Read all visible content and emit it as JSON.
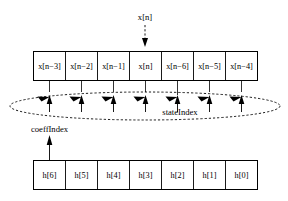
{
  "diagram": {
    "input_label": "x[n]",
    "state_index_label": "stateIndex",
    "coeff_index_label": "coeffIndex",
    "state_buffer": {
      "name": "state-buffer",
      "cells": [
        {
          "base": "x[n",
          "sub": "−3",
          "close": "]",
          "full": "x[n−3]"
        },
        {
          "base": "x[n",
          "sub": "−2",
          "close": "]",
          "full": "x[n−2]"
        },
        {
          "base": "x[n",
          "sub": "−1",
          "close": "]",
          "full": "x[n−1]"
        },
        {
          "base": "x[n",
          "sub": "",
          "close": "]",
          "full": "x[n]"
        },
        {
          "base": "x[n",
          "sub": "−6",
          "close": "]",
          "full": "x[n−6]"
        },
        {
          "base": "x[n",
          "sub": "−5",
          "close": "]",
          "full": "x[n−5]"
        },
        {
          "base": "x[n",
          "sub": "−4",
          "close": "]",
          "full": "x[n−4]"
        }
      ]
    },
    "coeff_buffer": {
      "name": "coefficient-buffer",
      "cells": [
        {
          "full": "h[6]"
        },
        {
          "full": "h[5]"
        },
        {
          "full": "h[4]"
        },
        {
          "full": "h[3]"
        },
        {
          "full": "h[2]"
        },
        {
          "full": "h[1]"
        },
        {
          "full": "h[0]"
        }
      ]
    },
    "colors": {
      "stroke": "#000000",
      "fill": "#ffffff"
    },
    "icons": {
      "input_arrow": "arrow-down-icon",
      "coeff_arrow": "arrow-up-icon",
      "tap_arrow": "arrow-up-icon",
      "ring_arrow": "arrow-curve-icon"
    }
  }
}
